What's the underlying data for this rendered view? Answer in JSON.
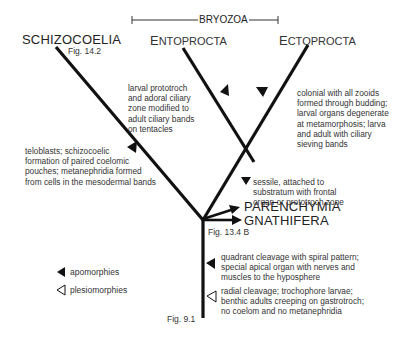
{
  "group": {
    "label": "BRYOZOA"
  },
  "taxa": {
    "schizocoelia": "SCHIZOCOELIA",
    "entoprocta_first": "E",
    "entoprocta_rest": "NTOPROCTA",
    "ectoprocta_first": "E",
    "ectoprocta_rest": "CTOPROCTA",
    "parenchymia": "PARENCHYMIA",
    "gnathifera": "GNATHIFERA"
  },
  "figure_refs": {
    "schizocoelia": "Fig. 14.2",
    "gnathifera": "Fig. 13.4 B",
    "base": "Fig. 9.1"
  },
  "characters": {
    "entoprocta": "larval prototroch\n   and adoral ciliary\n      zone modified to\n         adult ciliary bands\n            on tentacles",
    "ectoprocta": "colonial with all zooids\nformed through budding;\nlarval organs degenerate\nat metamorphosis; larva\nand adult with ciliary\nsieving bands",
    "schizocoelia": "teloblasts; schizocoelic\nformation of paired coelomic\npouches; metanephridia formed\nfrom cells in the mesodermal bands",
    "bryozoa": "sessile, attached to\nsubstratum with frontal\norgan or prototroch zone",
    "spiralia": "quadrant cleavage with spiral pattern;\nspecial apical organ with nerves and\nmuscles to the hyposphere",
    "base_plesio": "radial cleavage; trochophore larvae;\nbenthic adults creeping on gastrotroch;\nno coelom and no metanephridia"
  },
  "legend": {
    "apomorphies": {
      "icon": "filled-triangle",
      "label": "apomorphies"
    },
    "plesiomorphies": {
      "icon": "open-triangle",
      "label": "plesiomorphies"
    }
  },
  "colors": {
    "line": "#111111",
    "text": "#333333",
    "background": "#ffffff"
  }
}
